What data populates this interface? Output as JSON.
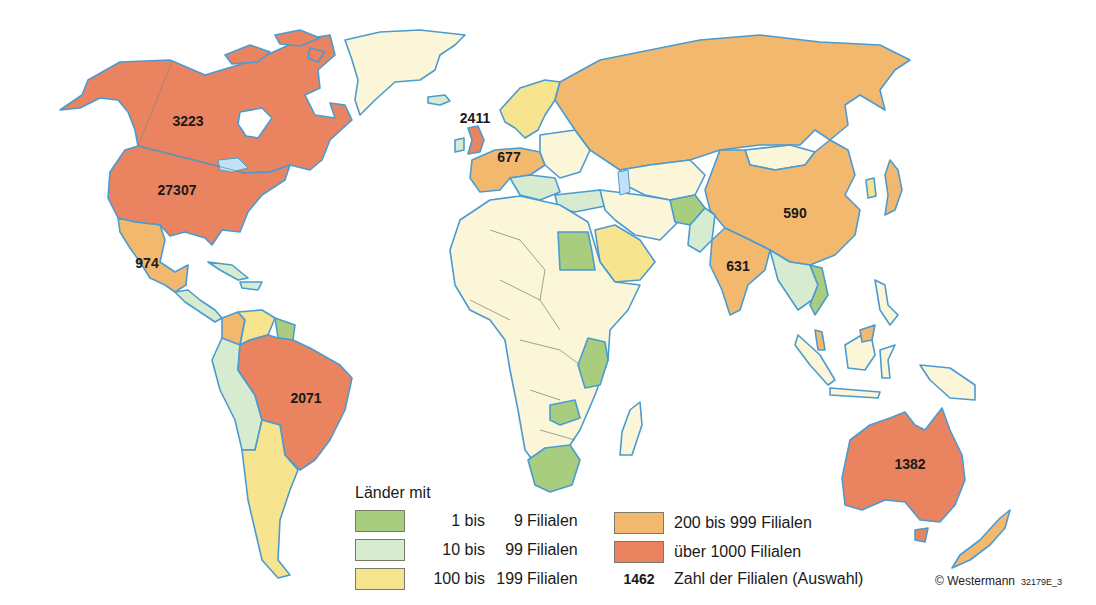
{
  "colors": {
    "c1_9": "#a9cd7e",
    "c10_99": "#d6ebd0",
    "c100_199": "#f7e48f",
    "c200_999": "#f2b96e",
    "c1000_plus": "#e98360",
    "no_data": "#fcf6d9",
    "water_outline": "#4a9bd1",
    "lake": "#bfe3f5"
  },
  "map": {
    "labels": [
      {
        "id": "canada",
        "value": "3223",
        "x": 188,
        "y": 121
      },
      {
        "id": "usa",
        "value": "27307",
        "x": 177,
        "y": 190
      },
      {
        "id": "mexico",
        "value": "974",
        "x": 147,
        "y": 263
      },
      {
        "id": "uk",
        "value": "2411",
        "x": 475,
        "y": 118
      },
      {
        "id": "germany",
        "value": "677",
        "x": 509,
        "y": 157
      },
      {
        "id": "china",
        "value": "590",
        "x": 795,
        "y": 213
      },
      {
        "id": "india",
        "value": "631",
        "x": 738,
        "y": 266
      },
      {
        "id": "brazil",
        "value": "2071",
        "x": 306,
        "y": 398
      },
      {
        "id": "australia",
        "value": "1382",
        "x": 910,
        "y": 464
      }
    ]
  },
  "legend": {
    "title": "Länder mit",
    "items": [
      {
        "from": "1 bis",
        "to": "9",
        "unit": "Filialen",
        "color_key": "c1_9"
      },
      {
        "from": "10 bis",
        "to": "99",
        "unit": "Filialen",
        "color_key": "c10_99"
      },
      {
        "from": "100 bis",
        "to": "199",
        "unit": "Filialen",
        "color_key": "c100_199"
      },
      {
        "label": "200 bis 999 Filialen",
        "color_key": "c200_999"
      },
      {
        "label": "über 1000 Filialen",
        "color_key": "c1000_plus"
      }
    ],
    "sample": {
      "number": "1462",
      "label": "Zahl der Filialen (Auswahl)"
    }
  },
  "footer": {
    "copyright": "© Westermann",
    "code": "32179E_3"
  }
}
